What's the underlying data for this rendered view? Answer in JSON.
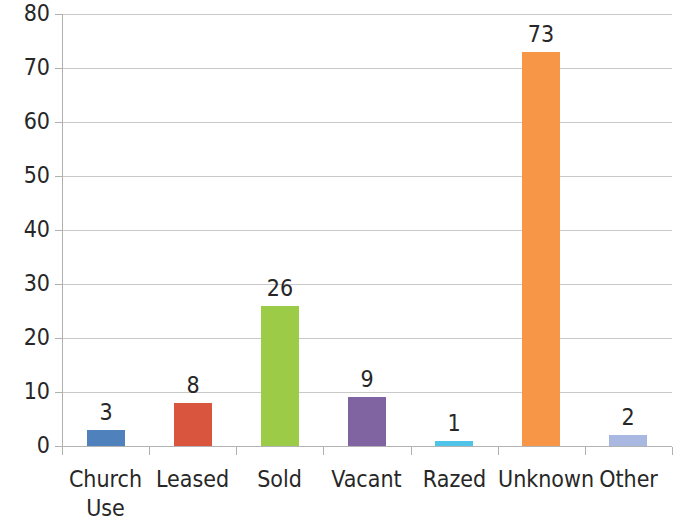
{
  "chart_data": {
    "type": "bar",
    "title": "",
    "subtitle": "",
    "xlabel": "",
    "ylabel": "",
    "categories": [
      "Church Use",
      "Leased",
      "Sold",
      "Vacant",
      "Razed",
      "Unknown",
      "Other"
    ],
    "category_display": [
      "Church\nUse",
      "Leased",
      "Sold",
      "Vacant",
      "Razed",
      "Unknown",
      "Other"
    ],
    "values": [
      3,
      8,
      26,
      9,
      1,
      73,
      2
    ],
    "data_labels": [
      "3",
      "8",
      "26",
      "9",
      "1",
      "73",
      "2"
    ],
    "bar_colors": [
      "#4f81bd",
      "#d9553d",
      "#9bcb47",
      "#8064a2",
      "#4fc3e8",
      "#f79646",
      "#a8b8e0"
    ],
    "ylim": [
      0,
      80
    ],
    "ytick_values": [
      0,
      10,
      20,
      30,
      40,
      50,
      60,
      70,
      80
    ],
    "ytick_labels": [
      "0",
      "10",
      "20",
      "30",
      "40",
      "50",
      "60",
      "70",
      "80"
    ],
    "grid": true,
    "grid_axis": "y",
    "legend": false,
    "legend_position": "none",
    "gridline_color": "#c9c9c9",
    "axis_color": "#b0b0b0",
    "text_color": "#272727",
    "background_color": "#ffffff"
  }
}
